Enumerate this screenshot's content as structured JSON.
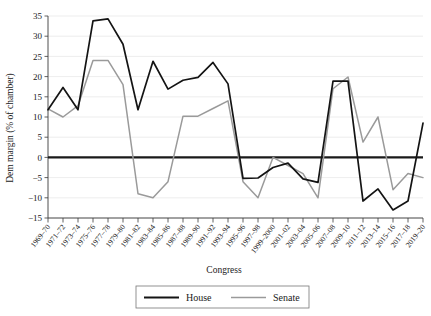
{
  "chart_data": {
    "type": "line",
    "title": "",
    "xlabel": "Congress",
    "ylabel": "Dem margin (% of chamber)",
    "ylim": [
      -15,
      35
    ],
    "ytick_step": 5,
    "grid": true,
    "legend_position": "bottom",
    "categories": [
      "1969–70",
      "1971–72",
      "1973–74",
      "1975–76",
      "1977–78",
      "1979–80",
      "1981–82",
      "1983–84",
      "1985–86",
      "1987–88",
      "1989–90",
      "1991–92",
      "1993–94",
      "1995–96",
      "1997–98",
      "1999–2000",
      "2001–02",
      "2003–04",
      "2005–06",
      "2007–08",
      "2009–10",
      "2011–12",
      "2013–14",
      "2015–16",
      "2017–18",
      "2019–20"
    ],
    "ytick_labels": [
      "35",
      "30",
      "25",
      "20",
      "15",
      "10",
      "5",
      "0",
      "−5",
      "−10",
      "−15"
    ],
    "ytick_values": [
      35,
      30,
      25,
      20,
      15,
      10,
      5,
      0,
      -5,
      -10,
      -15
    ],
    "series": [
      {
        "name": "House",
        "color": "#141414",
        "values": [
          11.8,
          17.3,
          11.8,
          33.8,
          34.3,
          28.0,
          11.8,
          23.8,
          16.9,
          19.1,
          19.8,
          23.5,
          18.2,
          -5.2,
          -5.1,
          -2.5,
          -1.4,
          -5.3,
          -6.2,
          18.9,
          18.9,
          -10.8,
          -7.8,
          -13.0,
          -10.8,
          8.5
        ]
      },
      {
        "name": "Senate",
        "color": "#9a9a9a",
        "values": [
          12.0,
          10.0,
          12.8,
          24.0,
          24.0,
          18.0,
          -9.0,
          -10.0,
          -6.0,
          10.2,
          10.2,
          12.1,
          14.0,
          -6.0,
          -10.0,
          0.0,
          -2.0,
          -4.0,
          -10.0,
          17.0,
          19.9,
          3.8,
          10.0,
          -8.0,
          -4.0,
          -5.0
        ]
      }
    ],
    "legend": [
      {
        "label": "House",
        "color": "#141414",
        "width": 1.7
      },
      {
        "label": "Senate",
        "color": "#9a9a9a",
        "width": 1.5
      }
    ]
  },
  "accent_colors": {
    "house": "#141414",
    "senate": "#9a9a9a",
    "grid": "#e9e9e9",
    "axis": "#3a3a3a",
    "background": "#ffffff"
  }
}
